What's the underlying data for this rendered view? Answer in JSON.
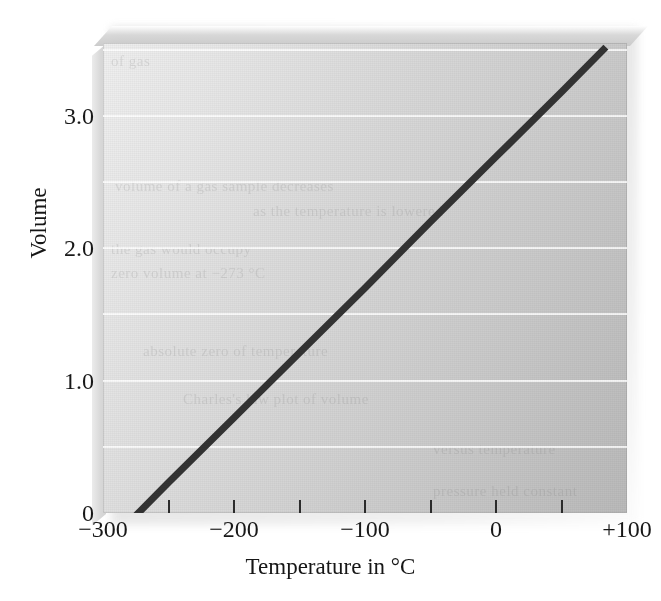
{
  "chart_data": {
    "type": "line",
    "title": "",
    "subtitle": "",
    "xlabel": "Temperature in °C",
    "ylabel": "Volume",
    "xlim": [
      -300,
      100
    ],
    "ylim": [
      0,
      3.55
    ],
    "grid": true,
    "legend_position": "none",
    "x_ticks": [
      -300,
      -250,
      -200,
      -150,
      -100,
      -50,
      0,
      50,
      100
    ],
    "x_tick_labels": [
      "−300",
      "",
      "−200",
      "",
      "−100",
      "",
      "0",
      "",
      "+100"
    ],
    "x_minor_tick_values": [
      -250,
      -200,
      -150,
      -100,
      -50,
      0,
      50
    ],
    "y_ticks": [
      0,
      1.0,
      2.0,
      3.0
    ],
    "y_tick_labels": [
      "0",
      "1.0",
      "2.0",
      "3.0"
    ],
    "y_gridline_values": [
      0.5,
      1.0,
      1.5,
      2.0,
      2.5,
      3.0,
      3.5
    ],
    "series": [
      {
        "name": "Volume vs Temperature",
        "color": "#333333",
        "line_width": 7,
        "x": [
          -273,
          -250,
          -200,
          -150,
          -100,
          -50,
          0,
          50,
          82
        ],
        "y": [
          0.0,
          0.23,
          0.72,
          1.21,
          1.7,
          2.2,
          2.69,
          3.18,
          3.5
        ]
      }
    ],
    "annotations": [
      {
        "text": "extrapolated line reaches zero volume at −273 °C",
        "shown": false
      }
    ],
    "faint_background_text": [
      {
        "text": "of gas",
        "x": 8,
        "y": 10
      },
      {
        "text": "volume of a gas sample decreases",
        "x": 12,
        "y": 135
      },
      {
        "text": "as the temperature is lowered",
        "x": 150,
        "y": 160
      },
      {
        "text": "the gas would occupy",
        "x": 8,
        "y": 198
      },
      {
        "text": "zero volume at −273 °C",
        "x": 8,
        "y": 222
      },
      {
        "text": "absolute zero of temperature",
        "x": 40,
        "y": 300
      },
      {
        "text": "Charles's law plot of volume",
        "x": 80,
        "y": 348
      },
      {
        "text": "versus temperature",
        "x": 330,
        "y": 398
      },
      {
        "text": "pressure held constant",
        "x": 330,
        "y": 440
      }
    ]
  },
  "axes": {
    "x_title": "Temperature in °C",
    "y_title": "Volume"
  },
  "colors": {
    "line": "#333333",
    "gridline": "#ffffff",
    "panel_light": "#efefef",
    "panel_dark": "#bababa",
    "text": "#181818"
  }
}
